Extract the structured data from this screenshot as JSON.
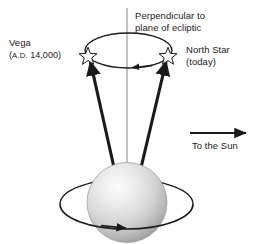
{
  "figure": {
    "background_color": "#ffffff",
    "ink_color": "#1a1a1a",
    "axis_line_color": "#9a9a9a",
    "sphere_light_color": "#f2f2f2",
    "sphere_mid_color": "#cfcfcf",
    "sphere_dark_color": "#8f8f8f"
  },
  "labels": {
    "perpendicular": "Perpendicular to\nplane of ecliptic",
    "vega": "Vega",
    "vega_epoch_prefix": "A.D.",
    "vega_epoch": "(A.D. 14,000)",
    "vega_epoch_year": "14,000)",
    "vega_epoch_open": "(",
    "north_star": "North Star",
    "north_star_sub": "(today)",
    "to_the_sun": "To the Sun"
  },
  "markers": {
    "star_vega": "star-icon",
    "star_northstar": "star-icon",
    "precession_direction": "arrow-left",
    "rotation_direction": "arrow-right",
    "sun_direction": "arrow-right"
  },
  "geometry": {
    "precession_ellipse": {
      "cx": 128.5,
      "cy": 50.5,
      "rx": 43.5,
      "ry": 17.5
    },
    "equator_ellipse": {
      "cx": 126.5,
      "cy": 204.0,
      "rx": 66.5,
      "ry": 25.0
    },
    "earth_sphere": {
      "cx": 127.0,
      "cy": 202.5,
      "r": 40.0
    },
    "vertical_axis": {
      "x": 127.0,
      "y1": 8.0,
      "y2": 168.0
    },
    "star_vega_pos": {
      "x": 88.0,
      "y": 55.0
    },
    "star_northstar_pos": {
      "x": 168.0,
      "y": 55.0
    },
    "sun_arrow": {
      "x1": 190.0,
      "x2": 248.0,
      "y": 133.0
    }
  }
}
